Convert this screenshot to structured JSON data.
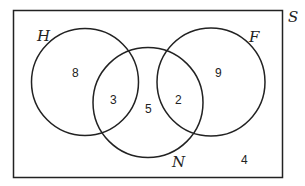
{
  "diagram": {
    "type": "venn",
    "universe_label": "S",
    "sets": [
      {
        "label": "H"
      },
      {
        "label": "F"
      },
      {
        "label": "N"
      }
    ],
    "regions": {
      "H_only": "8",
      "F_only": "9",
      "H_and_N_only": "3",
      "N_only": "5",
      "F_and_N_only": "2",
      "outside": "4"
    },
    "colors": {
      "stroke": "#222222",
      "background": "#ffffff"
    }
  }
}
